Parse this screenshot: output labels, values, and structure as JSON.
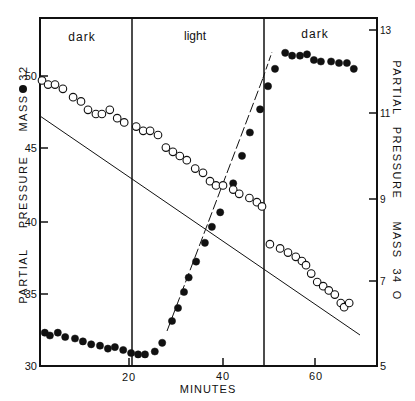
{
  "chart_data": {
    "type": "scatter",
    "title": "",
    "xlabel": "MINUTES",
    "ylabel_left": "PARTIAL PRESSURE MASS 32 ●",
    "ylabel_right": "PARTIAL PRESSURE MASS 34 O",
    "xlim": [
      0.8,
      73.5
    ],
    "ylim_left": [
      30,
      52.6
    ],
    "ylim_right": [
      5,
      13.7
    ],
    "x_ticks": [
      20,
      40,
      60
    ],
    "y_ticks_left": [
      30,
      35,
      40,
      45,
      50
    ],
    "y_ticks_right": [
      5,
      7,
      9,
      11,
      13
    ],
    "grid": false,
    "legend": "none (markers identified in axis labels)",
    "regions": [
      {
        "label": "dark",
        "x_start": 0.8,
        "x_end": 20.7
      },
      {
        "label": "light",
        "x_start": 20.7,
        "x_end": 49.1
      },
      {
        "label": "dark",
        "x_start": 49.1,
        "x_end": 73.5
      }
    ],
    "series": [
      {
        "name": "Mass 32 (filled circles)",
        "axis": "left",
        "marker": "filled-circle",
        "x": [
          1.9,
          3.0,
          4.7,
          6.3,
          8.4,
          10.1,
          11.9,
          13.8,
          15.5,
          17.0,
          18.8,
          20.5,
          22.0,
          23.5,
          25.6,
          27.2,
          29.3,
          30.6,
          31.9,
          32.9,
          34.5,
          36.4,
          37.9,
          39.7,
          42.5,
          44.4,
          46.1,
          48.3,
          50.0,
          51.5,
          53.7,
          55.2,
          56.9,
          58.4,
          59.9,
          61.4,
          63.6,
          65.3,
          67.0,
          68.5
        ],
        "y": [
          32.3,
          32.1,
          32.3,
          32.0,
          31.9,
          31.7,
          31.5,
          31.4,
          31.2,
          31.3,
          31.1,
          30.9,
          30.8,
          30.8,
          31.0,
          31.6,
          33.1,
          34.0,
          35.1,
          36.1,
          37.2,
          38.5,
          39.6,
          40.6,
          42.6,
          44.5,
          46.1,
          47.7,
          49.3,
          50.5,
          51.6,
          51.4,
          51.4,
          51.5,
          51.1,
          51.0,
          51.0,
          50.9,
          50.9,
          50.5
        ]
      },
      {
        "name": "Mass 34 (open circles)",
        "axis": "right",
        "marker": "open-circle",
        "x": [
          1.3,
          2.6,
          4.1,
          5.8,
          8.0,
          9.7,
          11.2,
          12.9,
          14.2,
          15.9,
          17.5,
          19.0,
          21.6,
          23.1,
          24.6,
          26.3,
          28.0,
          29.5,
          31.0,
          32.5,
          34.3,
          36.0,
          37.5,
          38.8,
          40.3,
          42.5,
          43.8,
          46.0,
          47.6,
          48.7,
          50.4,
          52.6,
          54.3,
          56.0,
          57.3,
          58.2,
          59.3,
          60.6,
          61.9,
          63.1,
          64.4,
          65.7,
          66.4,
          67.5
        ],
        "y": [
          11.8,
          11.7,
          11.7,
          11.6,
          11.4,
          11.3,
          11.1,
          11.0,
          11.0,
          11.1,
          10.9,
          10.8,
          10.7,
          10.6,
          10.6,
          10.5,
          10.2,
          10.1,
          10.0,
          9.9,
          9.7,
          9.6,
          9.4,
          9.3,
          9.3,
          9.2,
          9.1,
          9.0,
          8.9,
          8.8,
          7.9,
          7.8,
          7.7,
          7.6,
          7.5,
          7.4,
          7.2,
          7.0,
          6.9,
          6.8,
          6.7,
          6.5,
          6.4,
          6.5
        ]
      }
    ],
    "annotations": [
      "dark",
      "light",
      "dark"
    ]
  },
  "labels": {
    "region_dark_1": "dark",
    "region_light": "light",
    "region_dark_2": "dark",
    "x_axis_title": "MINUTES",
    "left_axis_title_1": "PARTIAL",
    "left_axis_title_2": "PRESSURE",
    "left_axis_title_3": "MASS",
    "left_axis_title_4": "32",
    "right_axis_title_1": "PARTIAL",
    "right_axis_title_2": "PRESSURE",
    "right_axis_title_3": "MASS",
    "right_axis_title_4": "34",
    "right_axis_symbol": "O",
    "xtick_20": "20",
    "xtick_40": "40",
    "xtick_60": "60",
    "ytick_l_30": "30",
    "ytick_l_35": "35",
    "ytick_l_40": "40",
    "ytick_l_45": "45",
    "ytick_l_50": "50",
    "ytick_r_5": "5",
    "ytick_r_7": "7",
    "ytick_r_9": "9",
    "ytick_r_11": "11",
    "ytick_r_13": "13"
  }
}
